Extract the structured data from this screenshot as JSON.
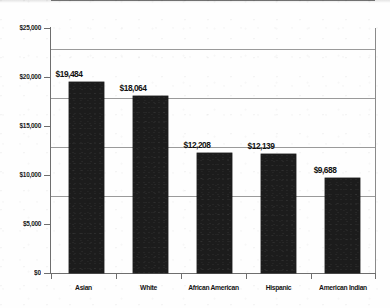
{
  "chart_data": {
    "type": "bar",
    "title": "",
    "subtitle": "",
    "xlabel": "",
    "ylabel": "",
    "categories": [
      "Asian",
      "White",
      "African American",
      "Hispanic",
      "American Indian"
    ],
    "values": [
      19484,
      18064,
      12208,
      12139,
      9688
    ],
    "data_labels": [
      "$19,484",
      "$18,064",
      "$12,208",
      "$12,139",
      "$9,688"
    ],
    "ylim": [
      0,
      25000
    ],
    "ytick_values": [
      25000,
      20000,
      15000,
      10000,
      5000,
      0
    ],
    "ytick_labels": [
      "$25,000",
      "$20,000",
      "$15,000",
      "$10,000",
      "$5,000",
      "$0"
    ],
    "grid": true,
    "grid_axis": "y",
    "legend": false,
    "legend_position": "none",
    "series": [
      {
        "name": "value",
        "values": [
          19484,
          18064,
          12208,
          12139,
          9688
        ]
      }
    ],
    "colors": {
      "bar": "#1c1c1c",
      "gridline": "#9a9a9a",
      "axis": "#6e6e6e",
      "text": "#141414",
      "background": "#ffffff"
    }
  }
}
